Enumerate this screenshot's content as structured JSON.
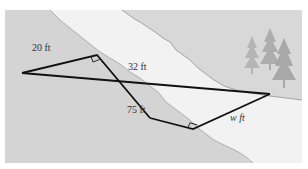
{
  "diagram": {
    "type": "geometry-river-width",
    "colors": {
      "bank_left": "#d4d4d4",
      "bank_right": "#d8d8d8",
      "river": "#f2f2f2",
      "line": "#111111",
      "tree": "#b5b5b5"
    },
    "labels": {
      "side_a": "20 ft",
      "side_b": "32 ft",
      "side_c": "75 ft",
      "side_w": "w ft"
    },
    "right_angle_markers": 2,
    "caption": ""
  }
}
